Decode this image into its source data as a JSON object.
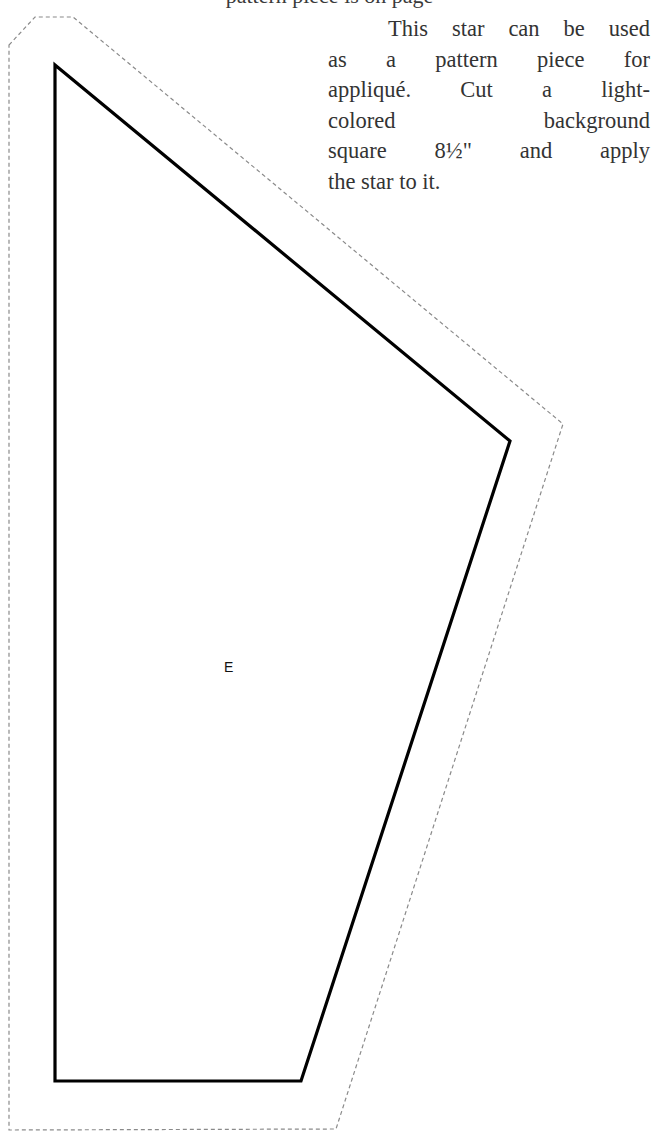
{
  "page": {
    "cutoff_heading_fragment": "pattern piece is on page",
    "instructions": {
      "lines": [
        "This star can be used",
        "as a pattern piece for",
        "appliqué. Cut a light-",
        "colored background",
        "square 8½\" and apply",
        "the star to it."
      ]
    },
    "pattern_piece": {
      "label": "E",
      "cut_line_points": "55,65 510,441 301,1081 55,1081",
      "seam_allowance_points": "9,45 35,17 73,17 563,424 336,1129 9,1130",
      "colors": {
        "cut_line": "#000000",
        "seam_allowance": "#8a8a8a",
        "text": "#333333"
      }
    }
  }
}
